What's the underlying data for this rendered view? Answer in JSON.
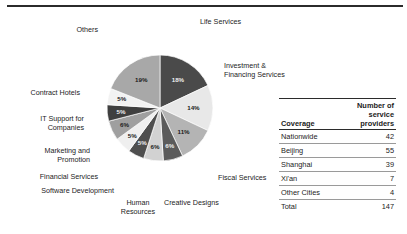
{
  "chart_data": {
    "type": "pie",
    "title": "",
    "legend_position": "outside-labels",
    "categories": [
      "Life Services",
      "Investment & Financing Services",
      "Fiscal Services",
      "Creative Designs",
      "Human Resources",
      "Software Development",
      "Financial Services",
      "Marketing and Promotion",
      "IT Support for Companies",
      "Contract Hotels",
      "Others"
    ],
    "values": [
      18,
      14,
      11,
      6,
      6,
      5,
      5,
      6,
      5,
      5,
      19
    ],
    "value_labels": [
      "18%",
      "14%",
      "11%",
      "6%",
      "6%",
      "5%",
      "5%",
      "6%",
      "5%",
      "5%",
      "19%"
    ],
    "colors": [
      "#4a4a4a",
      "#e8e8e8",
      "#b4b4b4",
      "#5b5b5b",
      "#d2d2d2",
      "#4f4f4f",
      "#efefef",
      "#9f9f9f",
      "#3f3f3f",
      "#f2f2f2",
      "#a8a8a8"
    ],
    "label_text_colors": [
      "light",
      "dark",
      "dark",
      "light",
      "dark",
      "light",
      "dark",
      "dark",
      "light",
      "dark",
      "dark"
    ],
    "start_angle_deg": 0,
    "direction": "clockwise",
    "unit": "%"
  },
  "pie_labels": [
    {
      "text": "Life Services"
    },
    {
      "text_line1": "Investment &",
      "text_line2": "Financing Services"
    },
    {
      "text": "Fiscal Services"
    },
    {
      "text": "Creative Designs"
    },
    {
      "text_line1": "Human",
      "text_line2": "Resources"
    },
    {
      "text": "Software Development"
    },
    {
      "text": "Financial Services"
    },
    {
      "text_line1": "Marketing and",
      "text_line2": "Promotion"
    },
    {
      "text_line1": "IT Support for",
      "text_line2": "Companies"
    },
    {
      "text": "Contract Hotels"
    },
    {
      "text": "Others"
    }
  ],
  "table": {
    "headers": {
      "coverage": "Coverage",
      "count_line1": "Number of",
      "count_line2": "service",
      "count_line3": "providers"
    },
    "rows": [
      {
        "name": "Nationwide",
        "value": "42"
      },
      {
        "name": "Beijing",
        "value": "55"
      },
      {
        "name": "Shanghai",
        "value": "39"
      },
      {
        "name": "Xi'an",
        "value": "7"
      },
      {
        "name": "Other Cities",
        "value": "4"
      },
      {
        "name": "Total",
        "value": "147"
      }
    ]
  }
}
